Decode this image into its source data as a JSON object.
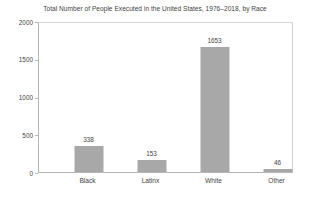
{
  "chart_data": {
    "type": "bar",
    "title": "Total Number of People Executed in the United States, 1976–2018, by Race",
    "xlabel": "",
    "ylabel": "",
    "categories": [
      "Black",
      "Latinx",
      "White",
      "Other"
    ],
    "values": [
      338,
      153,
      1653,
      46
    ],
    "data_labels": [
      "338",
      "153",
      "1653",
      "46"
    ],
    "ylim": [
      0,
      2000
    ],
    "ytick_labels": [
      "0",
      "500",
      "1000",
      "1500",
      "2000"
    ],
    "ytick_values": [
      0,
      500,
      1000,
      1500,
      2000
    ],
    "grid": false,
    "legend": "none",
    "series": [
      {
        "name": "People executed",
        "values": [
          338,
          153,
          1653,
          46
        ],
        "color": "#a8a8a8"
      }
    ],
    "colors": {
      "bar_fill": "#a8a8a8",
      "axis_line": "#b6b6b6",
      "text": "#3f3f3f",
      "background": "#ffffff"
    }
  }
}
